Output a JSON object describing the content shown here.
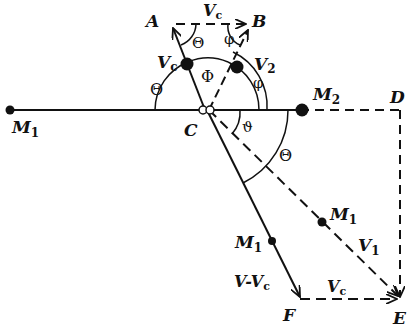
{
  "diagram": {
    "colors": {
      "ink": "#111111",
      "background": "#ffffff"
    },
    "points": {
      "A": {
        "label": "A"
      },
      "B": {
        "label": "B"
      },
      "C": {
        "label": "C"
      },
      "D": {
        "label": "D"
      },
      "E": {
        "label": "E"
      },
      "F": {
        "label": "F"
      }
    },
    "masses": {
      "m1_left": {
        "label": "M",
        "sub": "1"
      },
      "m2": {
        "label": "M",
        "sub": "2"
      },
      "m1_on_cf": {
        "label": "M",
        "sub": "1"
      },
      "m1_on_ce": {
        "label": "M",
        "sub": "1"
      }
    },
    "vectors": {
      "vc_top": {
        "label": "V",
        "sub": "c"
      },
      "vc_on_ca": {
        "label": "V",
        "sub": "c"
      },
      "v2": {
        "label": "V",
        "sub": "2"
      },
      "v1": {
        "label": "V",
        "sub": "1"
      },
      "v_minus_vc": {
        "label": "V-V",
        "sub": "c"
      },
      "vc_bottom": {
        "label": "V",
        "sub": "c"
      }
    },
    "angles": {
      "theta_top": "Θ",
      "phi_top": "φ",
      "theta_left": "Θ",
      "Phi_center": "Φ",
      "phi_right": "φ",
      "vartheta": "ϑ",
      "theta_lower": "Θ"
    }
  }
}
